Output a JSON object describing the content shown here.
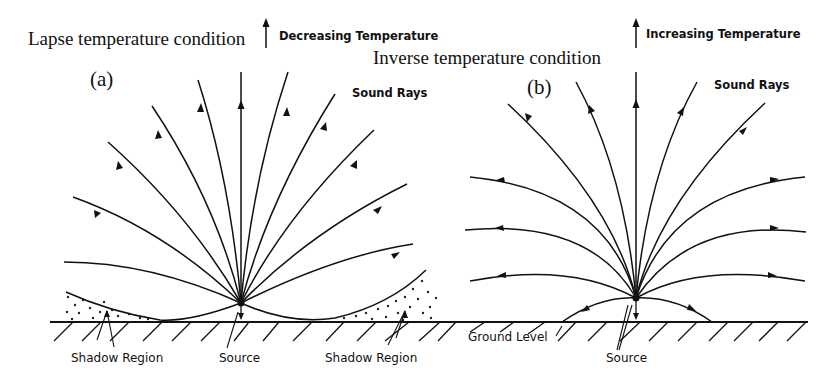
{
  "figure": {
    "panel_a": {
      "condition_label": "Lapse temperature condition",
      "gradient_label": "Decreasing Temperature",
      "panel_letter": "(a)",
      "rays_label": "Sound Rays",
      "shadow_left_label": "Shadow Region",
      "source_label": "Source",
      "shadow_right_label": "Shadow Region"
    },
    "panel_b": {
      "condition_label": "Inverse temperature condition",
      "gradient_label": "Increasing Temperature",
      "panel_letter": "(b)",
      "rays_label": "Sound Rays",
      "ground_label": "Ground Level",
      "source_label": "Source"
    },
    "colors": {
      "line": "#111111",
      "background": "#ffffff"
    }
  }
}
